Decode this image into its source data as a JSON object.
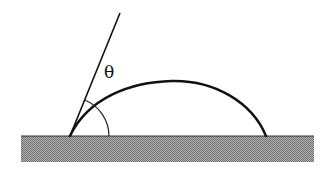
{
  "diagram": {
    "labels": {
      "angle_symbol": "θ"
    },
    "elements": {
      "substrate": {
        "description": "solid surface",
        "pattern": "stippled gray",
        "color": "#8a8a8a"
      },
      "droplet_profile": {
        "description": "liquid drop outline (spherical cap)",
        "color": "#111111"
      },
      "tangent_line": {
        "description": "tangent to drop at contact line",
        "color": "#111111"
      },
      "angle_arc": {
        "description": "arc marking contact angle θ",
        "color": "#222222"
      }
    },
    "colors": {
      "line": "#111111",
      "substrate_light": "#b5b5b5",
      "substrate_dark": "#6e6e6e",
      "background": "#ffffff"
    }
  }
}
